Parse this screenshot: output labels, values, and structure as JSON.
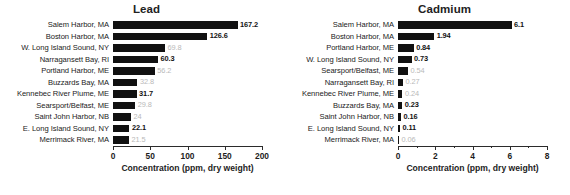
{
  "chart_data": [
    {
      "type": "bar",
      "orientation": "horizontal",
      "title": "Lead",
      "xlabel": "Concentration (ppm, dry weight)",
      "ylabel": "",
      "xlim": [
        0,
        200
      ],
      "xticks": [
        0,
        50,
        100,
        150,
        200
      ],
      "xticklabels": [
        "0",
        "50",
        "100",
        "150",
        "200"
      ],
      "grid": false,
      "legend": false,
      "categories": [
        "Salem Harbor, MA",
        "Boston Harbor, MA",
        "W. Long Island Sound, NY",
        "Narragansett Bay, RI",
        "Portland Harbor, ME",
        "Buzzards Bay, MA",
        "Kennebec River Plume, ME",
        "Searsport/Belfast, ME",
        "Saint John Harbor, NB",
        "E. Long Island Sound, NY",
        "Merrimack River, MA"
      ],
      "values": [
        167.2,
        126.6,
        69.8,
        60.3,
        56.2,
        32.8,
        31.7,
        29.8,
        24,
        22.1,
        21.5
      ],
      "value_labels": [
        "167.2",
        "126.6",
        "69.8",
        "60.3",
        "56.2",
        "32.8",
        "31.7",
        "29.8",
        "24",
        "22.1",
        "21.5"
      ],
      "bar_color": "#111111"
    },
    {
      "type": "bar",
      "orientation": "horizontal",
      "title": "Cadmium",
      "xlabel": "Concentration (ppm, dry weight)",
      "ylabel": "",
      "xlim": [
        0,
        8
      ],
      "xticks": [
        0,
        2,
        4,
        6,
        8
      ],
      "xticklabels": [
        "0",
        "2",
        "4",
        "6",
        "8"
      ],
      "minor_xticks": [
        1,
        3,
        5,
        7
      ],
      "grid": false,
      "legend": false,
      "categories": [
        "Salem Harbor, MA",
        "Boston Harbor, MA",
        "Portland Harbor, ME",
        "W. Long Island Sound, NY",
        "Searsport/Belfast, ME",
        "Narragansett Bay, RI",
        "Kennebec River Plume, ME",
        "Buzzards Bay, MA",
        "Saint John Harbor, NB",
        "E. Long Island Sound, NY",
        "Merrimack River, MA"
      ],
      "values": [
        6.1,
        1.94,
        0.84,
        0.73,
        0.54,
        0.27,
        0.24,
        0.23,
        0.16,
        0.11,
        0.06
      ],
      "value_labels": [
        "6.1",
        "1.94",
        "0.84",
        "0.73",
        "0.54",
        "0.27",
        "0.24",
        "0.23",
        "0.16",
        "0.11",
        "0.06"
      ],
      "bar_color": "#111111"
    }
  ]
}
